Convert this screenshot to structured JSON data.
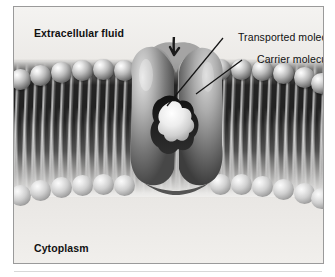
{
  "figure": {
    "background_color": "#f2f1ef",
    "border_color": "#9a9a9a",
    "style": "grayscale airbrush textbook illustration"
  },
  "labels": {
    "extracellular_fluid": "Extracellular fluid",
    "cytoplasm": "Cytoplasm",
    "transported_molecule": "Transported molecule",
    "carrier_molecule": "Carrier molecule"
  },
  "structures": {
    "membrane": {
      "name": "phospholipid bilayer",
      "upper_leaflet_heads": 12,
      "lower_leaflet_heads": 12,
      "head_color_light": "#ffffff",
      "head_color_dark": "#2b2b2b",
      "tail_color": "#1a1a1a"
    },
    "carrier_protein": {
      "name": "carrier molecule",
      "fill_light": "#d8d8d8",
      "fill_dark": "#3a3a3a"
    },
    "transported_molecule": {
      "name": "transported molecule",
      "shape": "clover",
      "fill": "#f0efed"
    },
    "entry_arrow": {
      "name": "molecule entry arrow",
      "direction": "downward into carrier cleft"
    }
  },
  "leader_lines": [
    {
      "label": "transported_molecule",
      "from_x": 222,
      "from_y": 30,
      "to_x": 166,
      "to_y": 102
    },
    {
      "label": "carrier_molecule",
      "from_x": 241,
      "from_y": 52,
      "to_x": 196,
      "to_y": 88
    }
  ]
}
